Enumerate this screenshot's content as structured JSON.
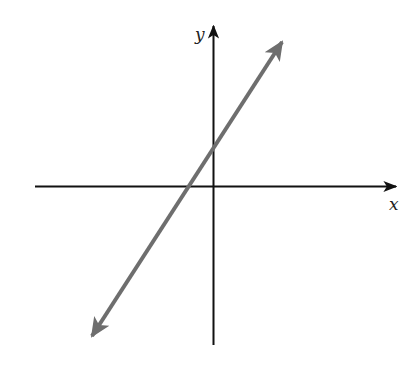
{
  "diagram": {
    "type": "coordinate-plane-line",
    "axes": {
      "x_label": "x",
      "y_label": "y",
      "color": "#111111"
    },
    "line": {
      "description": "straight line with positive slope, arrows at both ends",
      "color": "#6e6e6e",
      "x_intercept_side": "negative",
      "y_intercept_side": "positive"
    }
  }
}
